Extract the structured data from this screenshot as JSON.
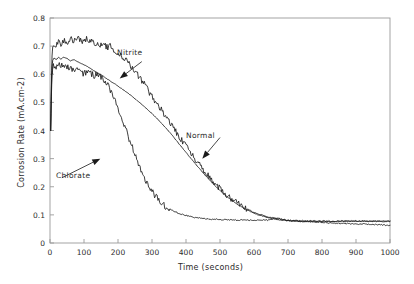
{
  "chart_data": {
    "type": "line",
    "title": "",
    "xlabel": "Time (seconds)",
    "ylabel": "Corrosion Rate (mA.cm-2)",
    "xlim": [
      0,
      1000
    ],
    "ylim": [
      0,
      0.8
    ],
    "xticks": [
      0,
      100,
      200,
      300,
      400,
      500,
      600,
      700,
      800,
      900,
      1000
    ],
    "yticks": [
      "0",
      "0.1",
      "0.2",
      "0.3",
      "0.4",
      "0.5",
      "0.6",
      "0.7",
      "0.8"
    ],
    "grid": false,
    "legend": "none",
    "frame_color": "#9a9a9a",
    "line_color": "#1a1a1a",
    "annotations": [
      {
        "text": "Nitrite",
        "series": "Nitrite",
        "label_x": 270,
        "label_y": 0.645,
        "arrow_to_x": 205,
        "arrow_to_y": 0.585
      },
      {
        "text": "Normal",
        "series": "Normal",
        "label_x": 500,
        "label_y": 0.375,
        "arrow_to_x": 448,
        "arrow_to_y": 0.3
      },
      {
        "text": "Chlorate",
        "series": "Chlorate",
        "label_x": 35,
        "label_y": 0.232,
        "arrow_to_x": 148,
        "arrow_to_y": 0.3
      }
    ],
    "series": [
      {
        "name": "Nitrite",
        "noisy": true,
        "x": [
          2,
          4,
          6,
          8,
          12,
          18,
          25,
          32,
          40,
          50,
          60,
          70,
          80,
          90,
          100,
          110,
          120,
          130,
          140,
          150,
          160,
          170,
          180,
          190,
          200,
          215,
          230,
          245,
          260,
          280,
          300,
          320,
          340,
          360,
          380,
          400,
          430,
          460,
          490,
          520,
          550,
          580,
          610,
          640,
          670,
          700,
          740,
          780,
          820,
          860,
          900,
          950,
          1000
        ],
        "y": [
          0.4,
          0.56,
          0.665,
          0.7,
          0.712,
          0.705,
          0.716,
          0.708,
          0.722,
          0.714,
          0.726,
          0.719,
          0.731,
          0.722,
          0.717,
          0.726,
          0.718,
          0.709,
          0.714,
          0.703,
          0.706,
          0.695,
          0.7,
          0.686,
          0.676,
          0.66,
          0.642,
          0.62,
          0.596,
          0.56,
          0.522,
          0.486,
          0.45,
          0.414,
          0.378,
          0.344,
          0.292,
          0.246,
          0.205,
          0.17,
          0.142,
          0.12,
          0.104,
          0.093,
          0.086,
          0.081,
          0.077,
          0.074,
          0.072,
          0.07,
          0.068,
          0.066,
          0.063
        ]
      },
      {
        "name": "Normal",
        "noisy": false,
        "x": [
          2,
          4,
          6,
          8,
          12,
          18,
          25,
          32,
          40,
          50,
          60,
          70,
          80,
          90,
          100,
          110,
          120,
          130,
          140,
          150,
          160,
          170,
          180,
          190,
          200,
          215,
          230,
          245,
          260,
          280,
          300,
          320,
          340,
          360,
          380,
          400,
          430,
          460,
          490,
          520,
          550,
          580,
          610,
          640,
          670,
          700,
          740,
          780,
          820,
          860,
          900,
          950,
          1000
        ],
        "y": [
          0.4,
          0.545,
          0.628,
          0.65,
          0.658,
          0.652,
          0.66,
          0.654,
          0.661,
          0.656,
          0.648,
          0.652,
          0.645,
          0.64,
          0.634,
          0.627,
          0.62,
          0.612,
          0.605,
          0.598,
          0.59,
          0.582,
          0.574,
          0.566,
          0.558,
          0.545,
          0.532,
          0.518,
          0.503,
          0.482,
          0.46,
          0.436,
          0.41,
          0.382,
          0.352,
          0.322,
          0.278,
          0.236,
          0.198,
          0.165,
          0.138,
          0.117,
          0.101,
          0.09,
          0.083,
          0.079,
          0.076,
          0.076,
          0.076,
          0.077,
          0.077,
          0.078,
          0.078
        ]
      },
      {
        "name": "Chlorate",
        "noisy": true,
        "x": [
          2,
          4,
          6,
          8,
          12,
          18,
          25,
          32,
          40,
          50,
          60,
          70,
          80,
          90,
          100,
          110,
          120,
          130,
          140,
          150,
          160,
          170,
          180,
          190,
          200,
          215,
          230,
          245,
          260,
          280,
          300,
          320,
          340,
          360,
          380,
          400,
          430,
          460,
          490,
          520,
          550,
          580,
          610,
          640,
          660,
          670,
          680,
          700,
          740,
          780,
          820,
          860,
          900,
          950,
          1000
        ],
        "y": [
          0.4,
          0.52,
          0.6,
          0.622,
          0.632,
          0.624,
          0.634,
          0.626,
          0.636,
          0.628,
          0.62,
          0.614,
          0.618,
          0.608,
          0.6,
          0.612,
          0.602,
          0.594,
          0.6,
          0.59,
          0.578,
          0.562,
          0.54,
          0.512,
          0.48,
          0.43,
          0.38,
          0.33,
          0.284,
          0.228,
          0.184,
          0.152,
          0.13,
          0.115,
          0.105,
          0.098,
          0.09,
          0.086,
          0.084,
          0.083,
          0.082,
          0.081,
          0.081,
          0.081,
          0.088,
          0.089,
          0.082,
          0.08,
          0.079,
          0.079,
          0.078,
          0.078,
          0.078,
          0.077,
          0.077
        ]
      }
    ]
  }
}
